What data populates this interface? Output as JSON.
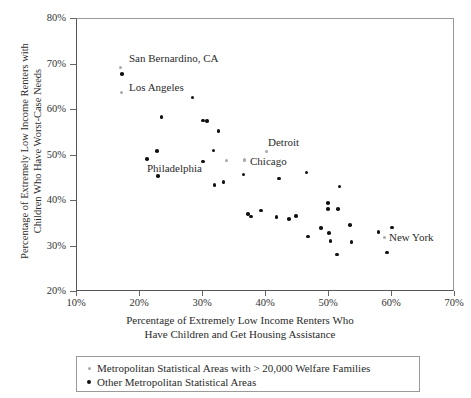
{
  "chart_data": {
    "type": "scatter",
    "title": "",
    "xlabel": "Percentage of Extremely Low Income Renters Who Have Children and Get Housing Assistance",
    "xlabel_line1": "Percentage of Extremely Low Income Renters Who",
    "xlabel_line2": "Have Children and Get Housing Assistance",
    "ylabel": "Percentage of Extremely Low Income Renters with Children Who Have Worst-Case Needs",
    "ylabel_line1": "Percentage of Extremely Low Income Renters with",
    "ylabel_line2": "Children Who Have Worst-Case Needs",
    "xlim": [
      10,
      70
    ],
    "ylim": [
      20,
      80
    ],
    "xticks": [
      "10%",
      "20%",
      "30%",
      "40%",
      "50%",
      "60%",
      "70%"
    ],
    "xtick_values": [
      10,
      20,
      30,
      40,
      50,
      60,
      70
    ],
    "yticks": [
      "20%",
      "30%",
      "40%",
      "50%",
      "60%",
      "70%",
      "80%"
    ],
    "ytick_values": [
      20,
      30,
      40,
      50,
      60,
      70,
      80
    ],
    "grid": false,
    "legend_position": "below-axes",
    "colors": {
      "major_metro": "#a9a9a9",
      "other_metro": "#111111",
      "axis": "#555555",
      "text": "#2b2b2b"
    },
    "series": [
      {
        "name": "Metropolitan Statistical Areas with > 20,000 Welfare Families",
        "marker": "small-gray-dot",
        "color": "#a9a9a9",
        "points": [
          {
            "x": 17.1,
            "y": 69.1,
            "label": "San Bernardino, CA"
          },
          {
            "x": 17.3,
            "y": 63.6,
            "label": "Los Angeles"
          },
          {
            "x": 33.9,
            "y": 48.6,
            "label": ""
          },
          {
            "x": 36.7,
            "y": 48.7,
            "label": ""
          },
          {
            "x": 40.2,
            "y": 50.7,
            "label": "Detroit"
          },
          {
            "x": 36.8,
            "y": 48.8,
            "label": "Chicago"
          },
          {
            "x": 58.9,
            "y": 31.8,
            "label": "New York"
          }
        ]
      },
      {
        "name": "Other Metropolitan Statistical Areas",
        "marker": "small-black-dot",
        "color": "#111111",
        "points": [
          {
            "x": 17.3,
            "y": 67.7
          },
          {
            "x": 28.5,
            "y": 62.5
          },
          {
            "x": 23.6,
            "y": 58.2
          },
          {
            "x": 30.2,
            "y": 57.5
          },
          {
            "x": 30.8,
            "y": 57.3
          },
          {
            "x": 32.6,
            "y": 55.2
          },
          {
            "x": 22.9,
            "y": 50.8
          },
          {
            "x": 31.8,
            "y": 50.9
          },
          {
            "x": 30.2,
            "y": 48.5
          },
          {
            "x": 21.3,
            "y": 49.0
          },
          {
            "x": 23.0,
            "y": 45.3
          },
          {
            "x": 32.0,
            "y": 43.3
          },
          {
            "x": 33.4,
            "y": 44.0
          },
          {
            "x": 36.6,
            "y": 45.6
          },
          {
            "x": 42.2,
            "y": 44.7
          },
          {
            "x": 46.6,
            "y": 46.0
          },
          {
            "x": 51.8,
            "y": 43.0
          },
          {
            "x": 50.0,
            "y": 39.4
          },
          {
            "x": 50.0,
            "y": 38.0
          },
          {
            "x": 51.6,
            "y": 38.0
          },
          {
            "x": 39.4,
            "y": 37.7
          },
          {
            "x": 37.3,
            "y": 36.9
          },
          {
            "x": 37.8,
            "y": 36.4
          },
          {
            "x": 41.8,
            "y": 36.3
          },
          {
            "x": 43.8,
            "y": 35.8
          },
          {
            "x": 44.9,
            "y": 36.5
          },
          {
            "x": 53.5,
            "y": 34.5
          },
          {
            "x": 48.9,
            "y": 33.9
          },
          {
            "x": 50.2,
            "y": 32.8
          },
          {
            "x": 50.4,
            "y": 31.0
          },
          {
            "x": 53.7,
            "y": 30.8
          },
          {
            "x": 46.8,
            "y": 32.0
          },
          {
            "x": 51.4,
            "y": 28.0
          },
          {
            "x": 58.0,
            "y": 33.0
          },
          {
            "x": 60.2,
            "y": 34.0
          },
          {
            "x": 59.4,
            "y": 28.5
          }
        ]
      }
    ],
    "annotations": [
      {
        "text": "San Bernardino, CA",
        "x_px": 129,
        "y_px": 52
      },
      {
        "text": "Los Angeles",
        "x_px": 129,
        "y_px": 81
      },
      {
        "text": "Philadelphia",
        "x_px": 147,
        "y_px": 162
      },
      {
        "text": "Detroit",
        "x_px": 268,
        "y_px": 136
      },
      {
        "text": "Chicago",
        "x_px": 250,
        "y_px": 155
      },
      {
        "text": "New York",
        "x_px": 389,
        "y_px": 231
      }
    ]
  },
  "legend": {
    "items": [
      {
        "label": "Metropolitan Statistical Areas with > 20,000 Welfare Families",
        "marker": "major"
      },
      {
        "label": "Other Metropolitan Statistical Areas",
        "marker": "other"
      }
    ]
  }
}
